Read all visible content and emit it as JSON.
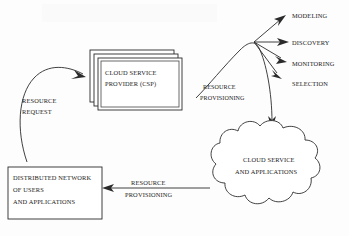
{
  "diagram": {
    "background_color": "#fdfdfd",
    "line_color": "#2b2b2b",
    "text_color": "#1a1a1a"
  },
  "csp_box": {
    "line1": "CLOUD SERVICE",
    "line2": "PROVIDER (CSP)",
    "stack_count": 3
  },
  "network_box": {
    "line1": "DISTRIBUTED NETWORK",
    "line2": "OF USERS",
    "line3": "AND APPLICATIONS"
  },
  "cloud": {
    "line1": "CLOUD SERVICE",
    "line2": "AND APPLICATIONS"
  },
  "arrows": {
    "resource_request": {
      "line1": "RESOURCE",
      "line2": "REQUEST"
    },
    "resource_provisioning_top": {
      "line1": "RESOURCE",
      "line2": "PROVISIONING"
    },
    "resource_provisioning_bottom": {
      "line1": "RESOURCE",
      "line2": "PROVISIONING"
    }
  },
  "fan_labels": [
    {
      "label": "MODELING"
    },
    {
      "label": "DISCOVERY"
    },
    {
      "label": "MONITORING"
    },
    {
      "label": "SELECTION"
    }
  ]
}
